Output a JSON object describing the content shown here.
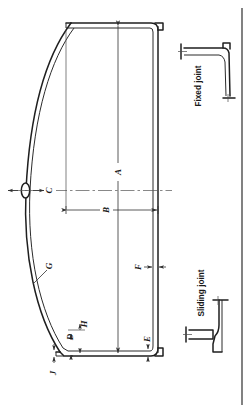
{
  "drawing": {
    "title": "Curved panel cross-section with joint details",
    "orientation": "rotated-90",
    "background_color": "#ffffff",
    "line_color": "#2b2b2b"
  },
  "dimension_labels": [
    {
      "id": "A",
      "text": "A",
      "note": "overall panel length between end flanges"
    },
    {
      "id": "B",
      "text": "B",
      "note": "half-span from centerline to flat edge"
    },
    {
      "id": "C",
      "text": "C",
      "note": "rise / crown offset at centerline boss"
    },
    {
      "id": "D",
      "text": "D",
      "note": "offset at lower end step"
    },
    {
      "id": "E",
      "text": "E",
      "note": "edge thickness at lower flat side"
    },
    {
      "id": "F",
      "text": "F",
      "note": "panel wall thickness at flat side"
    },
    {
      "id": "G",
      "text": "G",
      "note": "curved skin thickness"
    },
    {
      "id": "H",
      "text": "H",
      "note": "step height at lower end"
    },
    {
      "id": "J",
      "text": "J",
      "note": "lip projection at lower corner"
    }
  ],
  "detail_views": [
    {
      "id": "fixed-joint",
      "label": "Fixed joint"
    },
    {
      "id": "sliding-joint",
      "label": "Sliding joint"
    }
  ]
}
